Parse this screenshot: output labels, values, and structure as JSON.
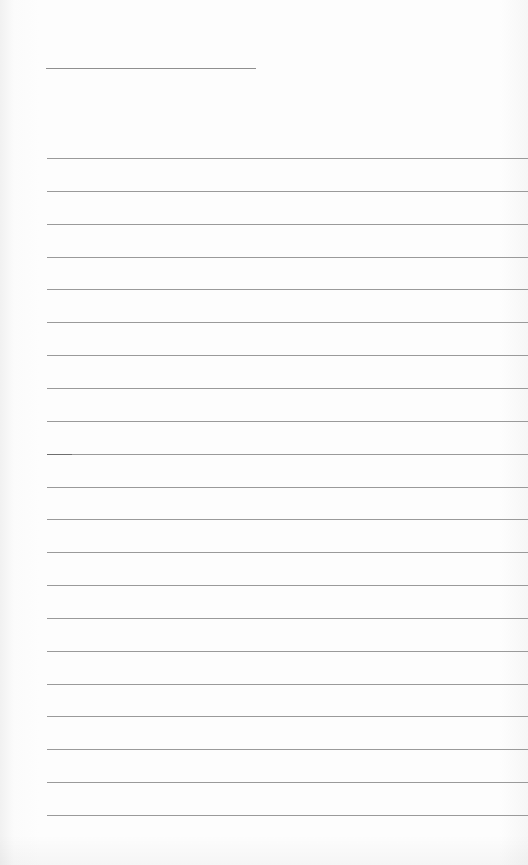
{
  "document": {
    "type": "lined-writing-sheet",
    "title_line": {
      "label": ""
    },
    "rules": {
      "count": 21,
      "first_top_px": 158,
      "spacing_px": 32.85,
      "line_color": "#9a9a9a"
    },
    "lines": [
      "",
      "",
      "",
      "",
      "",
      "",
      "",
      "",
      "",
      "",
      "",
      "",
      "",
      "",
      "",
      "",
      "",
      "",
      "",
      "",
      ""
    ]
  }
}
